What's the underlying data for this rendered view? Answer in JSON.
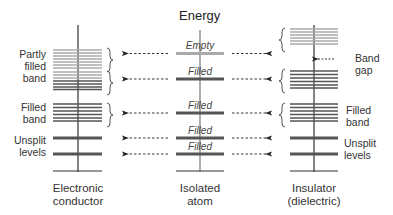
{
  "title": "Energy",
  "columns": {
    "conductor": {
      "label_line1": "Electronic",
      "label_line2": "conductor"
    },
    "atom": {
      "label_line1": "Isolated",
      "label_line2": "atom"
    },
    "insulator": {
      "label_line1": "Insulator",
      "label_line2": "(dielectric)"
    }
  },
  "left_labels": {
    "partly_filled": [
      "Partly",
      "filled",
      "band"
    ],
    "filled_band": [
      "Filled",
      "band"
    ],
    "unsplit": [
      "Unsplit",
      "levels"
    ]
  },
  "right_labels": {
    "band_gap": [
      "Band",
      "gap"
    ],
    "filled_band": [
      "Filled",
      "band"
    ],
    "unsplit": [
      "Unsplit",
      "levels"
    ]
  },
  "atom_levels": [
    {
      "label": "Empty",
      "state": "empty"
    },
    {
      "label": "Filled",
      "state": "filled"
    },
    {
      "label": "Filled",
      "state": "filled"
    },
    {
      "label": "Filled",
      "state": "filled"
    },
    {
      "label": "Filled",
      "state": "filled"
    }
  ],
  "colors": {
    "empty": "#aaaaaa",
    "filled": "#555555",
    "axis": "#333333"
  }
}
